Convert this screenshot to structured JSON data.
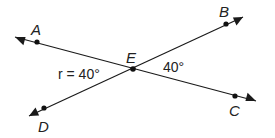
{
  "diagram": {
    "colors": {
      "line": "#1a1a1a",
      "point": "#111111",
      "text": "#222222",
      "background": "#ffffff"
    },
    "lines": [
      {
        "name": "line-AC",
        "from": [
          15,
          37
        ],
        "to": [
          256,
          101
        ],
        "arrows": "both",
        "through": [
          "A",
          "E",
          "C"
        ]
      },
      {
        "name": "line-DB",
        "from": [
          29,
          116
        ],
        "to": [
          243,
          17
        ],
        "arrows": "both",
        "through": [
          "D",
          "E",
          "B"
        ]
      }
    ],
    "points": [
      {
        "name": "A",
        "x": 37,
        "y": 42,
        "label": "A",
        "label_x": 31,
        "label_y": 35
      },
      {
        "name": "B",
        "x": 226,
        "y": 24,
        "label": "B",
        "label_x": 219,
        "label_y": 17
      },
      {
        "name": "C",
        "x": 235,
        "y": 96,
        "label": "C",
        "label_x": 229,
        "label_y": 116
      },
      {
        "name": "D",
        "x": 44,
        "y": 108,
        "label": "D",
        "label_x": 38,
        "label_y": 132
      },
      {
        "name": "E",
        "x": 133,
        "y": 69,
        "label": "E",
        "label_x": 126,
        "label_y": 63
      }
    ],
    "angles": [
      {
        "name": "angle-r",
        "text": "r = 40°",
        "x": 58,
        "y": 79
      },
      {
        "name": "angle-right",
        "text": "40°",
        "x": 163,
        "y": 72
      }
    ]
  }
}
